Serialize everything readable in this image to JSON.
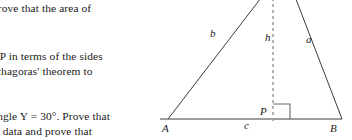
{
  "document": {
    "type": "textbook-exercise-fragment",
    "ink_color": "#1a1a1a",
    "dash_color": "#9a9a9a",
    "background": "#ffffff"
  },
  "text_column": {
    "paragraphs": [
      {
        "id": "para-1",
        "lines": [
          "prove that the area of"
        ]
      },
      {
        "id": "para-2",
        "lines": [
          "BP in terms of the sides",
          "ythagoras' theorem to"
        ]
      },
      {
        "id": "para-3",
        "lines": [
          "angle Y = 30°. Prove that",
          "is data and prove that"
        ]
      }
    ]
  },
  "figure": {
    "name": "triangle-with-altitude",
    "labels": {
      "side_b": "b",
      "height_h": "h",
      "side_a": "a",
      "base_c": "c",
      "foot_P": "P",
      "vertex_A": "A",
      "vertex_B": "B"
    },
    "geometry": {
      "vertex_A": [
        8,
        119
      ],
      "vertex_B": [
        182,
        119
      ],
      "apex_C": [
        123,
        -30
      ],
      "foot_P": [
        113,
        119
      ],
      "altitude_dashed": true,
      "right_angle_marker": true,
      "apex_clipped_at_top": true
    }
  }
}
